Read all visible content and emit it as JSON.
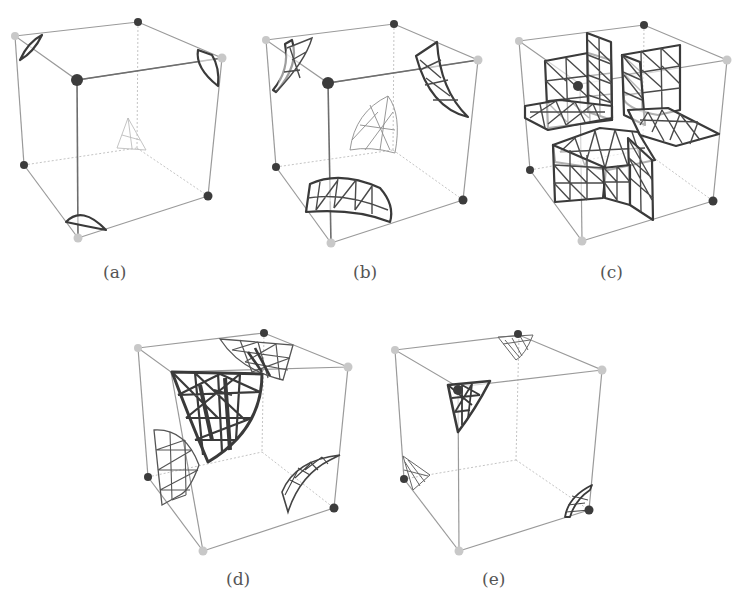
{
  "figure": {
    "panels": [
      {
        "id": "a",
        "label": "(a)",
        "description": "Cube with small dark curved surface patches near three corners and a faint small patch in the center"
      },
      {
        "id": "b",
        "label": "(b)",
        "description": "Cube with larger curved triangulated mesh patches near corners and a light spherical-triangle patch in the center"
      },
      {
        "id": "c",
        "label": "(c)",
        "description": "Cube containing orthogonal intersecting planar triangulated mesh sheets forming a cross-like structure"
      },
      {
        "id": "d",
        "label": "(d)",
        "description": "Cube with a large dark curved mesh patch near the top-front-left corner and lighter patches near other corners"
      },
      {
        "id": "e",
        "label": "(e)",
        "description": "Cube with a dark triangular mesh at the top-front-left corner and small light patches near other corners"
      }
    ],
    "colors": {
      "dark_vertex": "#3c3c3c",
      "light_vertex": "#c8c8c8",
      "mesh": "#3a3a3a",
      "edge": "#9a9a9a",
      "label": "#555555"
    }
  }
}
